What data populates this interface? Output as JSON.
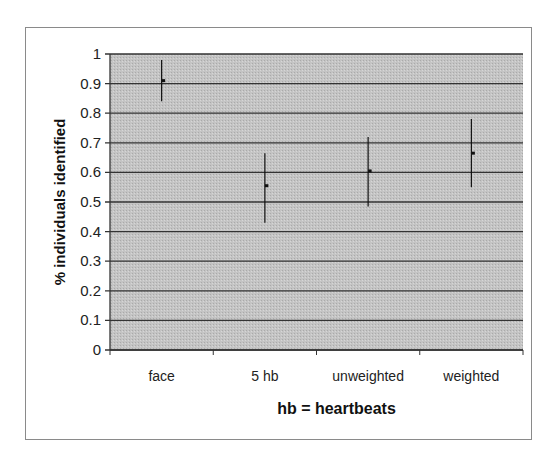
{
  "chart_data": {
    "type": "scatter",
    "title": "",
    "xlabel": "hb = heartbeats",
    "ylabel": "% individuals identified",
    "ylim": [
      0,
      1
    ],
    "yticks": [
      "0",
      "0.1",
      "0.2",
      "0.3",
      "0.4",
      "0.5",
      "0.6",
      "0.7",
      "0.8",
      "0.9",
      "1"
    ],
    "categories": [
      "face",
      "5 hb",
      "unweighted",
      "weighted"
    ],
    "values": [
      0.91,
      0.555,
      0.605,
      0.665
    ],
    "error_low": [
      0.84,
      0.43,
      0.485,
      0.55
    ],
    "error_high": [
      0.98,
      0.665,
      0.72,
      0.78
    ],
    "grid": true,
    "legend": null,
    "colors": {
      "plot_bg": "#c4c4c4",
      "grid": "#333333",
      "marker": "#111111"
    }
  }
}
